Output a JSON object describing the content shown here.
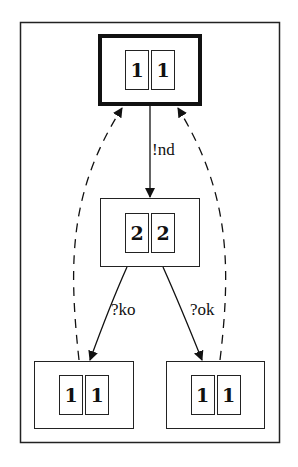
{
  "diagram": {
    "type": "state-machine",
    "nodes": [
      {
        "id": "n0",
        "cells": [
          "1",
          "1"
        ],
        "initial": true
      },
      {
        "id": "n1",
        "cells": [
          "2",
          "2"
        ],
        "initial": false
      },
      {
        "id": "n2",
        "cells": [
          "1",
          "1"
        ],
        "initial": false
      },
      {
        "id": "n3",
        "cells": [
          "1",
          "1"
        ],
        "initial": false
      }
    ],
    "edges": [
      {
        "from": "n0",
        "to": "n1",
        "label": "!nd",
        "style": "solid"
      },
      {
        "from": "n1",
        "to": "n2",
        "label": "?ko",
        "style": "solid"
      },
      {
        "from": "n1",
        "to": "n3",
        "label": "?ok",
        "style": "solid"
      },
      {
        "from": "n2",
        "to": "n0",
        "label": "",
        "style": "dashed"
      },
      {
        "from": "n3",
        "to": "n0",
        "label": "",
        "style": "dashed"
      }
    ]
  }
}
